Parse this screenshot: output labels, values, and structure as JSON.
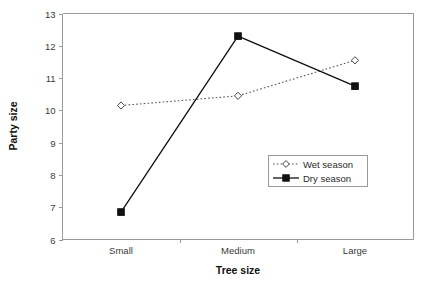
{
  "chart_data": {
    "type": "line",
    "title": "",
    "xlabel": "Tree size",
    "ylabel": "Party size",
    "categories": [
      "Small",
      "Medium",
      "Large"
    ],
    "ylim": [
      6,
      13
    ],
    "ytick_labels": [
      "6",
      "7",
      "8",
      "9",
      "10",
      "11",
      "12",
      "13"
    ],
    "yticks": [
      6,
      7,
      8,
      9,
      10,
      11,
      12,
      13
    ],
    "grid": false,
    "legend_position": "inside-center-right",
    "series": [
      {
        "name": "Wet season",
        "values": [
          10.15,
          10.45,
          11.55
        ],
        "line_style": "dotted",
        "marker": "open-diamond",
        "color": "#555555"
      },
      {
        "name": "Dry season",
        "values": [
          6.85,
          12.3,
          10.75
        ],
        "line_style": "solid",
        "marker": "filled-square",
        "color": "#111111"
      }
    ]
  },
  "legend": {
    "entries": [
      {
        "label": "Wet season"
      },
      {
        "label": "Dry season"
      }
    ]
  },
  "axes": {
    "x_title": "Tree size",
    "y_title": "Party size"
  },
  "colors": {
    "frame": "#9a9a9a",
    "dry_series": "#111111",
    "wet_series": "#555555",
    "background": "#ffffff"
  }
}
